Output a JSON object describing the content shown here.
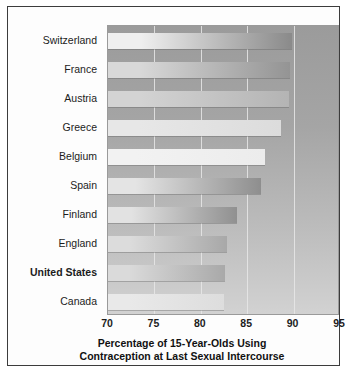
{
  "chart_data": {
    "type": "bar",
    "orientation": "horizontal",
    "title": "Percentage of 15-Year-Olds Using Contraception at Last Sexual Intercourse",
    "title_line1": "Percentage of 15-Year-Olds Using",
    "title_line2": "Contraception at Last Sexual Intercourse",
    "xlabel": "Percentage of 15-Year-Olds Using Contraception at Last Sexual Intercourse",
    "ylabel": "",
    "xlim": [
      70,
      95
    ],
    "ylim": [
      0,
      10
    ],
    "xticks": [
      70,
      75,
      80,
      85,
      90,
      95
    ],
    "grid": "vertical",
    "legend": "none",
    "highlighted_category": "United States",
    "categories": [
      "Switzerland",
      "France",
      "Austria",
      "Greece",
      "Belgium",
      "Spain",
      "Finland",
      "England",
      "United States",
      "Canada"
    ],
    "values": [
      89.8,
      89.6,
      89.5,
      88.6,
      86.9,
      86.5,
      83.9,
      82.8,
      82.6,
      82.5
    ],
    "bars": [
      {
        "label": "Switzerland",
        "value": 89.8,
        "bold": false,
        "fill_light": "#efefef",
        "fill_dark": "#8a8a8a"
      },
      {
        "label": "France",
        "value": 89.6,
        "bold": false,
        "fill_light": "#d8d8d8",
        "fill_dark": "#949494"
      },
      {
        "label": "Austria",
        "value": 89.5,
        "bold": false,
        "fill_light": "#d3d3d3",
        "fill_dark": "#b4b4b4"
      },
      {
        "label": "Greece",
        "value": 88.6,
        "bold": false,
        "fill_light": "#e7e7e7",
        "fill_dark": "#dcdcdc"
      },
      {
        "label": "Belgium",
        "value": 86.9,
        "bold": false,
        "fill_light": "#f2f2f2",
        "fill_dark": "#ececec"
      },
      {
        "label": "Spain",
        "value": 86.5,
        "bold": false,
        "fill_light": "#e4e4e4",
        "fill_dark": "#8e8e8e"
      },
      {
        "label": "Finland",
        "value": 83.9,
        "bold": false,
        "fill_light": "#e2e2e2",
        "fill_dark": "#909090"
      },
      {
        "label": "England",
        "value": 82.8,
        "bold": false,
        "fill_light": "#dcdcdc",
        "fill_dark": "#a8a8a8"
      },
      {
        "label": "United States",
        "value": 82.6,
        "bold": true,
        "fill_light": "#dadada",
        "fill_dark": "#a9a9a9"
      },
      {
        "label": "Canada",
        "value": 82.5,
        "bold": false,
        "fill_light": "#e9e9e9",
        "fill_dark": "#dddddd"
      }
    ]
  },
  "colors": {
    "frame_border": "#3c3c3c",
    "card_background": "#fdfdfd",
    "plot_background_top": "#9b9b9b",
    "plot_background_bottom": "#d2d2d2",
    "gridline": "#e8e8e8",
    "text": "#1c1c1c"
  }
}
